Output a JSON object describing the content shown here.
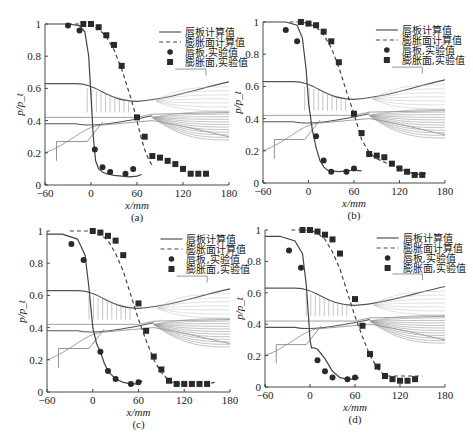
{
  "figure": {
    "x_label": "x/mm",
    "y_label": "p/p_t",
    "x_ticks": [
      "-60",
      "0",
      "60",
      "120",
      "180"
    ],
    "y_ticks": [
      "0",
      "0.2",
      "0.4",
      "0.6",
      "0.8",
      "1"
    ],
    "legend": [
      {
        "label": "唇板计算值",
        "style": "solid-line"
      },
      {
        "label": "膨胀面计算值",
        "style": "dashed-line"
      },
      {
        "label": "唇板,实验值",
        "style": "circle-marker"
      },
      {
        "label": "膨胀面,实验值",
        "style": "square-marker"
      }
    ],
    "colors": {
      "axis": "#333333",
      "line": "#444444",
      "marker": "#2a2a2a",
      "contour": "#8a8a8a"
    }
  },
  "panels": [
    {
      "caption": "(a)"
    },
    {
      "caption": "(b)"
    },
    {
      "caption": "(c)"
    },
    {
      "caption": "(d)"
    }
  ],
  "chart_data": [
    {
      "type": "line",
      "title": "(a)",
      "xlabel": "x/mm",
      "ylabel": "p/p_t",
      "xlim": [
        -60,
        180
      ],
      "ylim": [
        0,
        1
      ],
      "series": [
        {
          "name": "唇板计算值",
          "style": "solid",
          "x": [
            -60,
            -30,
            -15,
            -8,
            -3,
            0,
            3,
            6,
            10,
            15,
            20,
            30,
            40,
            50,
            60,
            66
          ],
          "y": [
            1.0,
            1.0,
            0.99,
            0.95,
            0.8,
            0.55,
            0.3,
            0.15,
            0.1,
            0.08,
            0.07,
            0.06,
            0.055,
            0.05,
            0.055,
            0.065
          ]
        },
        {
          "name": "膨胀面计算值",
          "style": "dashed",
          "x": [
            -30,
            -10,
            0,
            10,
            20,
            30,
            40,
            50,
            55,
            60,
            65,
            70,
            75,
            80
          ],
          "y": [
            1.0,
            1.0,
            0.99,
            0.97,
            0.92,
            0.84,
            0.72,
            0.57,
            0.49,
            0.4,
            0.3,
            0.22,
            0.16,
            0.12
          ]
        },
        {
          "name": "唇板,实验值",
          "style": "circle",
          "x": [
            -30,
            -15,
            5,
            15,
            25,
            45,
            55
          ],
          "y": [
            0.99,
            0.96,
            0.22,
            0.11,
            0.08,
            0.07,
            0.1
          ]
        },
        {
          "name": "膨胀面,实验值",
          "style": "square",
          "x": [
            -10,
            0,
            10,
            20,
            30,
            40,
            60,
            70,
            80,
            90,
            100,
            110,
            120,
            130,
            140,
            150
          ],
          "y": [
            1.0,
            1.0,
            0.98,
            0.93,
            0.87,
            0.74,
            0.42,
            0.3,
            0.18,
            0.17,
            0.15,
            0.13,
            0.1,
            0.07,
            0.07,
            0.07
          ]
        }
      ],
      "legend_position": "upper right"
    },
    {
      "type": "line",
      "title": "(b)",
      "xlabel": "x/mm",
      "ylabel": "p/p_t",
      "xlim": [
        -60,
        180
      ],
      "ylim": [
        0,
        1
      ],
      "series": [
        {
          "name": "唇板计算值",
          "style": "solid",
          "x": [
            -60,
            -30,
            -15,
            -8,
            -3,
            0,
            5,
            10,
            15,
            20,
            25,
            30,
            40,
            50,
            60,
            70
          ],
          "y": [
            1.0,
            1.0,
            0.98,
            0.9,
            0.7,
            0.5,
            0.33,
            0.22,
            0.14,
            0.1,
            0.08,
            0.075,
            0.07,
            0.075,
            0.08,
            0.075
          ]
        },
        {
          "name": "膨胀面计算值",
          "style": "dashed",
          "x": [
            -25,
            -10,
            0,
            10,
            20,
            30,
            40,
            50,
            60,
            65,
            70,
            80,
            90,
            100,
            110,
            120,
            130,
            140,
            150,
            155
          ],
          "y": [
            1.0,
            1.0,
            0.99,
            0.97,
            0.92,
            0.84,
            0.72,
            0.57,
            0.43,
            0.35,
            0.27,
            0.19,
            0.15,
            0.13,
            0.11,
            0.09,
            0.07,
            0.055,
            0.05,
            0.06
          ]
        },
        {
          "name": "唇板,实验值",
          "style": "circle",
          "x": [
            -30,
            -15,
            10,
            20,
            30,
            50,
            60
          ],
          "y": [
            0.95,
            0.88,
            0.29,
            0.14,
            0.07,
            0.07,
            0.09
          ]
        },
        {
          "name": "膨胀面,实验值",
          "style": "square",
          "x": [
            -10,
            0,
            10,
            20,
            30,
            40,
            60,
            70,
            80,
            90,
            100,
            110,
            120,
            130,
            140,
            150
          ],
          "y": [
            1.0,
            0.99,
            0.98,
            0.94,
            0.88,
            0.75,
            0.43,
            0.31,
            0.18,
            0.17,
            0.16,
            0.12,
            0.09,
            0.07,
            0.05,
            0.05
          ]
        }
      ],
      "legend_position": "upper right"
    },
    {
      "type": "line",
      "title": "(c)",
      "xlabel": "x/mm",
      "ylabel": "p/p_t",
      "xlim": [
        -60,
        180
      ],
      "ylim": [
        0,
        1
      ],
      "series": [
        {
          "name": "唇板计算值",
          "style": "solid",
          "x": [
            -60,
            -40,
            -20,
            -10,
            -5,
            0,
            5,
            10,
            15,
            20,
            30,
            40,
            50,
            60,
            65
          ],
          "y": [
            0.98,
            0.98,
            0.95,
            0.85,
            0.65,
            0.4,
            0.3,
            0.25,
            0.18,
            0.13,
            0.08,
            0.06,
            0.05,
            0.05,
            0.07
          ]
        },
        {
          "name": "膨胀面计算值",
          "style": "dashed",
          "x": [
            -30,
            -10,
            0,
            10,
            20,
            30,
            40,
            50,
            60,
            70,
            80,
            90,
            100,
            110,
            120,
            130,
            140,
            150,
            160
          ],
          "y": [
            1.0,
            1.0,
            1.0,
            0.98,
            0.94,
            0.86,
            0.75,
            0.6,
            0.45,
            0.32,
            0.2,
            0.12,
            0.07,
            0.05,
            0.05,
            0.05,
            0.05,
            0.05,
            0.06
          ]
        },
        {
          "name": "唇板,实验值",
          "style": "circle",
          "x": [
            -28,
            -12,
            10,
            20,
            30,
            50,
            60
          ],
          "y": [
            0.92,
            0.82,
            0.25,
            0.13,
            0.08,
            0.05,
            0.06
          ]
        },
        {
          "name": "膨胀面,实验值",
          "style": "square",
          "x": [
            0,
            10,
            20,
            30,
            40,
            60,
            70,
            80,
            90,
            100,
            110,
            120,
            130,
            140,
            150
          ],
          "y": [
            1.0,
            0.99,
            0.97,
            0.94,
            0.85,
            0.55,
            0.38,
            0.22,
            0.14,
            0.07,
            0.05,
            0.05,
            0.05,
            0.05,
            0.05
          ]
        }
      ],
      "legend_position": "upper right"
    },
    {
      "type": "line",
      "title": "(d)",
      "xlabel": "x/mm",
      "ylabel": "p/p_t",
      "xlim": [
        -60,
        180
      ],
      "ylim": [
        0,
        1
      ],
      "series": [
        {
          "name": "唇板计算值",
          "style": "solid",
          "x": [
            -60,
            -40,
            -20,
            -10,
            -5,
            -2,
            0,
            2,
            5,
            10,
            20,
            30,
            40,
            50,
            60,
            65
          ],
          "y": [
            0.96,
            0.96,
            0.93,
            0.85,
            0.65,
            0.45,
            0.3,
            0.25,
            0.25,
            0.24,
            0.18,
            0.1,
            0.06,
            0.05,
            0.05,
            0.06
          ]
        },
        {
          "name": "膨胀面计算值",
          "style": "dashed",
          "x": [
            -25,
            -10,
            0,
            10,
            20,
            30,
            40,
            50,
            60,
            70,
            80,
            90,
            100,
            110,
            120,
            130,
            140,
            150
          ],
          "y": [
            1.0,
            1.0,
            1.0,
            0.98,
            0.94,
            0.86,
            0.75,
            0.6,
            0.45,
            0.32,
            0.2,
            0.12,
            0.07,
            0.07,
            0.07,
            0.07,
            0.07,
            0.07
          ]
        },
        {
          "name": "唇板,实验值",
          "style": "circle",
          "x": [
            -28,
            -12,
            10,
            20,
            30,
            50,
            60
          ],
          "y": [
            0.87,
            0.76,
            0.17,
            0.1,
            0.06,
            0.05,
            0.06
          ]
        },
        {
          "name": "膨胀面,实验值",
          "style": "square",
          "x": [
            -10,
            0,
            10,
            20,
            30,
            40,
            60,
            70,
            80,
            90,
            100,
            110,
            120,
            130,
            140
          ],
          "y": [
            1.0,
            1.0,
            0.99,
            0.97,
            0.94,
            0.85,
            0.56,
            0.39,
            0.21,
            0.13,
            0.07,
            0.05,
            0.04,
            0.04,
            0.05
          ]
        }
      ],
      "legend_position": "upper right"
    }
  ]
}
